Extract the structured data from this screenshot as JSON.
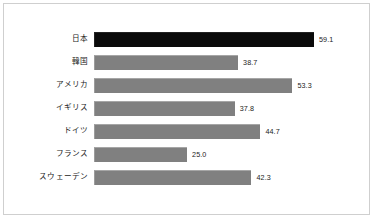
{
  "chart_data": {
    "type": "bar",
    "orientation": "horizontal",
    "title": "",
    "subtitle": "",
    "xlabel": "",
    "ylabel": "",
    "grid": false,
    "legend": null,
    "xlim": [
      0,
      59.1
    ],
    "categories": [
      "日本",
      "韓国",
      "アメリカ",
      "イギリス",
      "ドイツ",
      "フランス",
      "スウェーデン"
    ],
    "values": [
      59.1,
      38.7,
      53.3,
      37.8,
      44.7,
      25.0,
      42.3
    ],
    "value_labels": [
      "59.1",
      "38.7",
      "53.3",
      "37.8",
      "44.7",
      "25.0",
      "42.3"
    ],
    "bar_colors": [
      "#0a0a0a",
      "#808080",
      "#808080",
      "#808080",
      "#808080",
      "#808080",
      "#808080"
    ],
    "highlight_index": 0,
    "colors": {
      "highlight": "#0a0a0a",
      "default": "#808080",
      "frame_border": "#cfcfcf",
      "background": "#ffffff",
      "text": "#1a1a1a"
    }
  }
}
